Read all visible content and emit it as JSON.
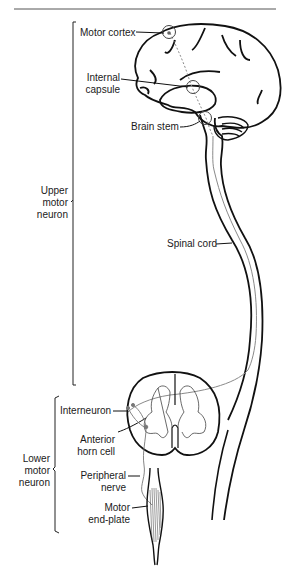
{
  "diagram": {
    "labels": {
      "motor_cortex": "Motor cortex",
      "internal_capsule_1": "Internal",
      "internal_capsule_2": "capsule",
      "brain_stem": "Brain stem",
      "spinal_cord": "Spinal cord",
      "interneuron": "Interneuron",
      "anterior_horn_1": "Anterior",
      "anterior_horn_2": "horn cell",
      "peripheral_nerve_1": "Peripheral",
      "peripheral_nerve_2": "nerve",
      "motor_endplate_1": "Motor",
      "motor_endplate_2": "end-plate"
    },
    "groups": {
      "upper": [
        "Upper",
        "motor",
        "neuron"
      ],
      "lower": [
        "Lower",
        "motor",
        "neuron"
      ]
    },
    "colors": {
      "ink": "#111111",
      "pathway": "#8a8a8a",
      "rule": "#555555"
    }
  }
}
